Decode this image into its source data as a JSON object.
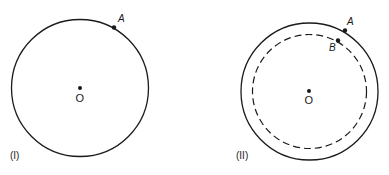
{
  "figure_1": {
    "caption": "(I)",
    "point_a_label": "A",
    "center_label": "O"
  },
  "figure_2": {
    "caption": "(II)",
    "point_a_label": "A",
    "point_b_label": "B",
    "center_label": "O"
  },
  "colors": {
    "ink": "#1a1a1a",
    "background": "#ffffff"
  }
}
